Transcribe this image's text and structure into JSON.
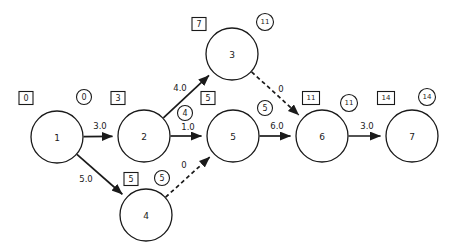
{
  "diagram": {
    "type": "project-network-cpm",
    "title": "",
    "background_color": "#ffffff",
    "stroke_color": "#1a1a1a",
    "width": 455,
    "height": 252
  },
  "nodes": [
    {
      "id": "n1",
      "label": "1",
      "cx": 57,
      "cy": 137,
      "r": 26
    },
    {
      "id": "n2",
      "label": "2",
      "cx": 144,
      "cy": 136,
      "r": 26
    },
    {
      "id": "n3",
      "label": "3",
      "cx": 232,
      "cy": 54,
      "r": 26
    },
    {
      "id": "n4",
      "label": "4",
      "cx": 146,
      "cy": 215,
      "r": 26
    },
    {
      "id": "n5",
      "label": "5",
      "cx": 233,
      "cy": 136,
      "r": 26
    },
    {
      "id": "n6",
      "label": "6",
      "cx": 322,
      "cy": 136,
      "r": 26
    },
    {
      "id": "n7",
      "label": "7",
      "cx": 412,
      "cy": 136,
      "r": 26
    }
  ],
  "edges": [
    {
      "id": "e1",
      "from": "n1",
      "to": "n2",
      "weight": "3.0",
      "style": "solid",
      "label_x": 100,
      "label_y": 126
    },
    {
      "id": "e2",
      "from": "n1",
      "to": "n4",
      "weight": "5.0",
      "style": "solid",
      "label_x": 86,
      "label_y": 179
    },
    {
      "id": "e3",
      "from": "n2",
      "to": "n3",
      "weight": "4.0",
      "style": "solid",
      "label_x": 180,
      "label_y": 88
    },
    {
      "id": "e4",
      "from": "n2",
      "to": "n5",
      "weight": "1.0",
      "style": "solid",
      "label_x": 188,
      "label_y": 127
    },
    {
      "id": "e5",
      "from": "n4",
      "to": "n5",
      "weight": "0",
      "style": "dashed",
      "label_x": 184,
      "label_y": 165
    },
    {
      "id": "e6",
      "from": "n3",
      "to": "n6",
      "weight": "0",
      "style": "dashed",
      "label_x": 281,
      "label_y": 89
    },
    {
      "id": "e7",
      "from": "n5",
      "to": "n6",
      "weight": "6.0",
      "style": "solid",
      "label_x": 277,
      "label_y": 126
    },
    {
      "id": "e8",
      "from": "n6",
      "to": "n7",
      "weight": "3.0",
      "style": "solid",
      "label_x": 367,
      "label_y": 126
    }
  ],
  "tags": [
    {
      "id": "t1",
      "shape": "box",
      "value": "0",
      "node": "n1",
      "x": 26,
      "y": 98
    },
    {
      "id": "t2",
      "shape": "circle",
      "value": "0",
      "node": "n1",
      "x": 84,
      "y": 97
    },
    {
      "id": "t3",
      "shape": "box",
      "value": "3",
      "node": "n2",
      "x": 118,
      "y": 98
    },
    {
      "id": "t4",
      "shape": "circle",
      "value": "4",
      "node": "n2",
      "x": 185,
      "y": 113
    },
    {
      "id": "t5",
      "shape": "box",
      "value": "7",
      "node": "n3",
      "x": 199,
      "y": 24
    },
    {
      "id": "t6",
      "shape": "circle",
      "value": "11",
      "node": "n3",
      "x": 265,
      "y": 22
    },
    {
      "id": "t7",
      "shape": "box",
      "value": "5",
      "node": "n5",
      "x": 208,
      "y": 98
    },
    {
      "id": "t8",
      "shape": "circle",
      "value": "5",
      "node": "n5",
      "x": 265,
      "y": 108
    },
    {
      "id": "t9",
      "shape": "box",
      "value": "5",
      "node": "n4",
      "x": 131,
      "y": 179
    },
    {
      "id": "t10",
      "shape": "circle",
      "value": "5",
      "node": "n4",
      "x": 162,
      "y": 178
    },
    {
      "id": "t11",
      "shape": "box",
      "value": "11",
      "node": "n6",
      "x": 311,
      "y": 98
    },
    {
      "id": "t12",
      "shape": "circle",
      "value": "11",
      "node": "n6",
      "x": 349,
      "y": 103
    },
    {
      "id": "t13",
      "shape": "box",
      "value": "14",
      "node": "n7",
      "x": 386,
      "y": 98
    },
    {
      "id": "t14",
      "shape": "circle",
      "value": "14",
      "node": "n7",
      "x": 427,
      "y": 97
    }
  ]
}
